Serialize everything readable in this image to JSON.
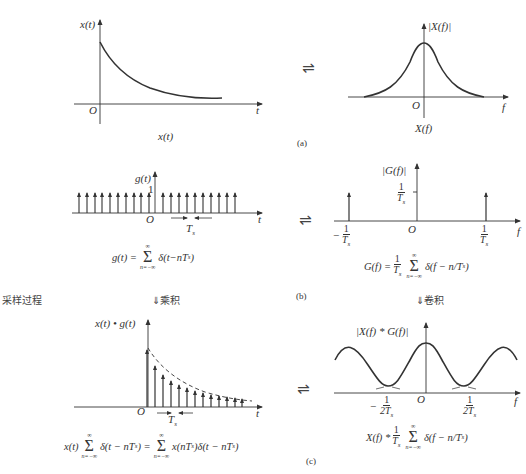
{
  "figure": {
    "side_label": "采样过程",
    "transform_symbol": "⇌",
    "panel_a": {
      "tag": "(a)",
      "time": {
        "ylabel": "x(t)",
        "origin": "O",
        "xlabel": "t",
        "caption": "x(t)"
      },
      "freq": {
        "ylabel": "|X(f)|",
        "origin": "O",
        "xlabel": "f",
        "caption": "X(f)"
      }
    },
    "panel_b": {
      "tag": "(b)",
      "time": {
        "ylabel": "g(t)",
        "unit_mark": "1",
        "origin": "O",
        "xlabel": "t",
        "spacing_label": "T",
        "spacing_sub": "s",
        "formula_lhs": "g(t) =",
        "sum_top": "∞",
        "sum_bottom": "n=−∞",
        "formula_rhs": "δ(t−nT",
        "formula_sub": "s",
        "formula_end": ")"
      },
      "freq": {
        "ylabel": "|G(f)|",
        "height_num": "1",
        "height_den": "T",
        "height_den_sub": "s",
        "origin": "O",
        "xlabel": "f",
        "left_tick_sign": "−",
        "left_tick_num": "1",
        "left_tick_den": "T",
        "right_tick_num": "1",
        "right_tick_den": "T",
        "tick_sub": "s",
        "formula_lhs": "G(f) =",
        "formula_coef_num": "1",
        "formula_coef_den": "T",
        "sum_top": "∞",
        "sum_bottom": "n=−∞",
        "formula_rhs": "δ(f − n/T",
        "formula_sub": "s",
        "formula_end": ")"
      }
    },
    "operation_time": "⇓乘积",
    "operation_freq": "⇓卷积",
    "panel_c": {
      "tag": "(c)",
      "time": {
        "ylabel": "x(t) • g(t)",
        "origin": "O",
        "xlabel": "t",
        "spacing_label": "T",
        "spacing_sub": "s",
        "formula_a": "x(t)",
        "sum_top": "∞",
        "sum_bottom": "n=−∞",
        "formula_b": "δ(t − nT",
        "formula_c": ") =",
        "formula_d": "x(nT",
        "formula_e": ")δ(t − nT",
        "formula_sub": "s",
        "formula_end": ")"
      },
      "freq": {
        "ylabel": "|X(f) * G(f)|",
        "origin": "O",
        "xlabel": "f",
        "left_tick_sign": "−",
        "tick_num": "1",
        "tick_den": "2T",
        "tick_sub": "s",
        "formula_a": "X(f) *",
        "formula_coef_num": "1",
        "formula_coef_den": "T",
        "sum_top": "∞",
        "sum_bottom": "n=−∞",
        "formula_rhs": "δ(f − n/T",
        "formula_sub": "s",
        "formula_end": ")"
      }
    }
  }
}
